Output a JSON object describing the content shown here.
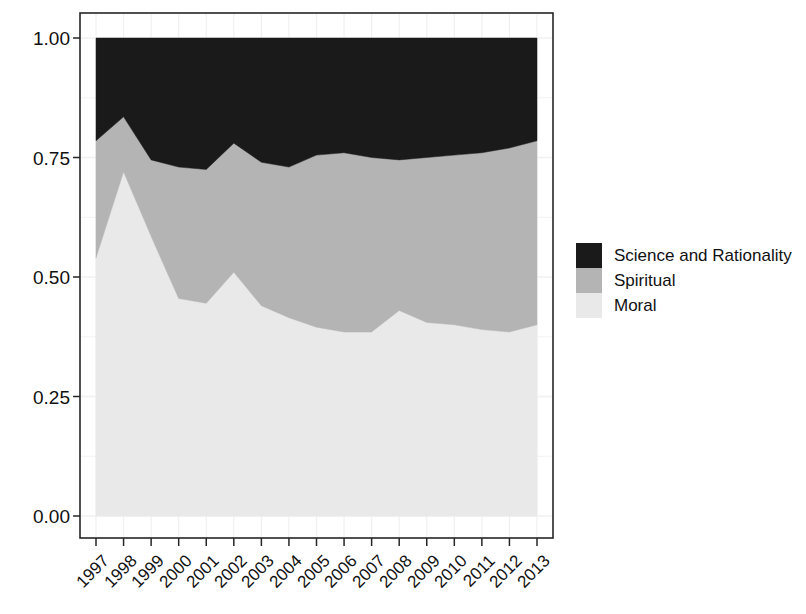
{
  "chart_data": {
    "type": "area",
    "stacked": true,
    "normalized": true,
    "title": "",
    "subtitle": "",
    "xlabel": "",
    "ylabel": "",
    "grid": true,
    "legend_position": "right",
    "x": [
      1997,
      1998,
      1999,
      2000,
      2001,
      2002,
      2003,
      2004,
      2005,
      2006,
      2007,
      2008,
      2009,
      2010,
      2011,
      2012,
      2013
    ],
    "categories": [
      "1997",
      "1998",
      "1999",
      "2000",
      "2001",
      "2002",
      "2003",
      "2004",
      "2005",
      "2006",
      "2007",
      "2008",
      "2009",
      "2010",
      "2011",
      "2012",
      "2013"
    ],
    "ylim": [
      0.0,
      1.0
    ],
    "y_ticks": [
      0.0,
      0.25,
      0.5,
      0.75,
      1.0
    ],
    "y_tick_labels": [
      "0.00",
      "0.25",
      "0.50",
      "0.75",
      "1.00"
    ],
    "series": [
      {
        "name": "Moral",
        "color": "#e9e9e9",
        "values": [
          0.54,
          0.72,
          0.585,
          0.455,
          0.445,
          0.51,
          0.44,
          0.415,
          0.395,
          0.385,
          0.385,
          0.43,
          0.405,
          0.4,
          0.39,
          0.385,
          0.4
        ]
      },
      {
        "name": "Spiritual",
        "color": "#b4b4b4",
        "values": [
          0.245,
          0.115,
          0.16,
          0.275,
          0.28,
          0.27,
          0.3,
          0.315,
          0.36,
          0.375,
          0.365,
          0.315,
          0.345,
          0.355,
          0.37,
          0.385,
          0.385
        ]
      },
      {
        "name": "Science and Rationality",
        "color": "#1a1a1a",
        "values": [
          0.215,
          0.165,
          0.255,
          0.27,
          0.275,
          0.22,
          0.26,
          0.27,
          0.245,
          0.24,
          0.25,
          0.255,
          0.25,
          0.245,
          0.24,
          0.23,
          0.215
        ]
      }
    ],
    "stack_order_bottom_to_top": [
      "Moral",
      "Spiritual",
      "Science and Rationality"
    ],
    "boundaries": {
      "moral_top": [
        0.54,
        0.72,
        0.585,
        0.455,
        0.445,
        0.51,
        0.44,
        0.415,
        0.395,
        0.385,
        0.385,
        0.43,
        0.405,
        0.4,
        0.39,
        0.385,
        0.4
      ],
      "spiritual_top": [
        0.785,
        0.835,
        0.745,
        0.73,
        0.725,
        0.78,
        0.74,
        0.73,
        0.755,
        0.76,
        0.75,
        0.745,
        0.75,
        0.755,
        0.76,
        0.77,
        0.785
      ]
    }
  },
  "legend": {
    "items": [
      {
        "label": "Science and Rationality",
        "color": "#1a1a1a"
      },
      {
        "label": "Spiritual",
        "color": "#b4b4b4"
      },
      {
        "label": "Moral",
        "color": "#e9e9e9"
      }
    ]
  },
  "axes": {
    "y_tick_labels": [
      "1.00",
      "0.75",
      "0.50",
      "0.25",
      "0.00"
    ],
    "x_tick_labels": [
      "1997",
      "1998",
      "1999",
      "2000",
      "2001",
      "2002",
      "2003",
      "2004",
      "2005",
      "2006",
      "2007",
      "2008",
      "2009",
      "2010",
      "2011",
      "2012",
      "2013"
    ]
  },
  "geometry": {
    "panel_left": 80,
    "panel_right": 553,
    "panel_top": 13,
    "panel_bottom": 538,
    "data_left": 96,
    "data_right": 537,
    "y_zero_px": 516,
    "y_one_px": 38
  },
  "colors": {
    "science": "#1a1a1a",
    "spiritual": "#b4b4b4",
    "moral": "#e9e9e9",
    "axis": "#262626",
    "grid": "#f0f0f0",
    "text": "#111111",
    "background": "#ffffff"
  }
}
